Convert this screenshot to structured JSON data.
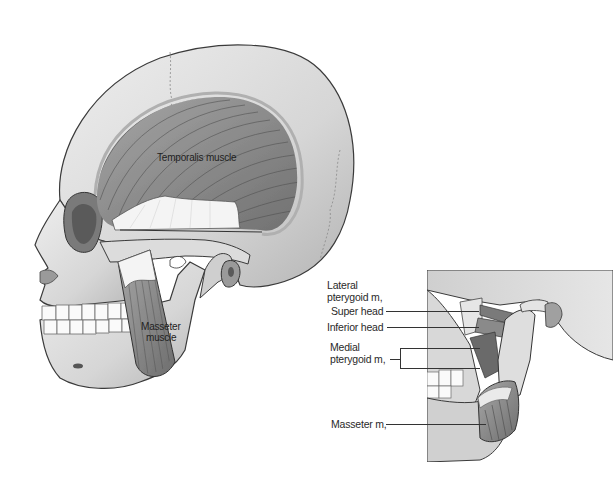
{
  "figure": {
    "palette": {
      "background": "#ffffff",
      "bone_light": "#e2e2e2",
      "bone_mid": "#c8c8c8",
      "bone_shadow": "#9a9a9a",
      "muscle": "#8c8c8c",
      "muscle_dark": "#5e5e5e",
      "tendon": "#f4f4f4",
      "outline": "#3a3a3a",
      "teeth": "#fafafa",
      "label_text": "#2a2a2a"
    }
  },
  "main_view": {
    "labels": {
      "temporalis": "Temporalis muscle",
      "masseter_line1": "Masseter",
      "masseter_line2": "muscle"
    }
  },
  "inset_view": {
    "labels": {
      "lateral_pterygoid_line1": "Lateral",
      "lateral_pterygoid_line2": "pterygoid m,",
      "super_head": "Super head",
      "inferior_head": "Inferior head",
      "medial_pterygoid_line1": "Medial",
      "medial_pterygoid_line2": "pterygoid m,",
      "masseter": "Masseter m,"
    }
  }
}
